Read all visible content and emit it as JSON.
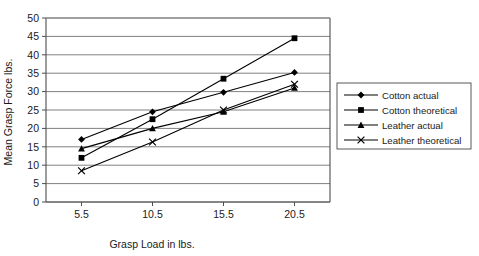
{
  "chart_data": {
    "type": "line",
    "title": "",
    "xlabel": "Grasp Load in lbs.",
    "ylabel": "Mean Grasp Force lbs.",
    "categories": [
      "5.5",
      "10.5",
      "15.5",
      "20.5"
    ],
    "x": [
      5.5,
      10.5,
      15.5,
      20.5
    ],
    "xlim": [
      3.0,
      23.0
    ],
    "ylim": [
      0,
      50
    ],
    "ytick_labels": [
      "0",
      "5",
      "10",
      "15",
      "20",
      "25",
      "30",
      "35",
      "40",
      "45",
      "50"
    ],
    "yticks": [
      0,
      5,
      10,
      15,
      20,
      25,
      30,
      35,
      40,
      45,
      50
    ],
    "xtick_labels": [
      "5.5",
      "10.5",
      "15.5",
      "20.5"
    ],
    "grid": "horizontal",
    "legend_position": "right",
    "series": [
      {
        "name": "Cotton actual",
        "marker": "diamond",
        "color": "#000000",
        "values": [
          17.0,
          24.5,
          29.8,
          35.2
        ]
      },
      {
        "name": "Cotton theoretical",
        "marker": "square",
        "color": "#000000",
        "values": [
          12.0,
          22.5,
          33.5,
          44.5
        ]
      },
      {
        "name": "Leather actual",
        "marker": "triangle",
        "color": "#000000",
        "values": [
          14.5,
          20.0,
          24.5,
          31.0
        ]
      },
      {
        "name": "Leather theoretical",
        "marker": "cross",
        "color": "#000000",
        "values": [
          8.5,
          16.3,
          25.0,
          32.0
        ]
      }
    ]
  },
  "legend": {
    "entries": [
      {
        "label": "Cotton actual",
        "marker": "diamond"
      },
      {
        "label": "Cotton theoretical",
        "marker": "square"
      },
      {
        "label": "Leather actual",
        "marker": "triangle"
      },
      {
        "label": "Leather theoretical",
        "marker": "cross"
      }
    ]
  },
  "style": {
    "grid_color": "#808080",
    "axis_color": "#4d4d4d",
    "series_color": "#000000",
    "background": "#ffffff"
  }
}
